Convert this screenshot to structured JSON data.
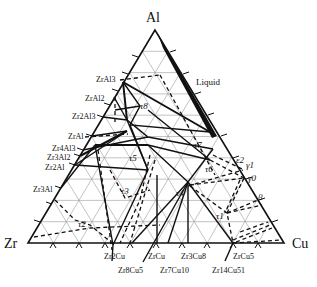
{
  "diagram": {
    "type": "ternary-phase-diagram",
    "vertices": {
      "top": "Al",
      "left": "Zr",
      "right": "Cu"
    },
    "region_label": "Liquid",
    "left_edge_phases": [
      "ZrAl3",
      "ZrAl2",
      "Zr2Al3",
      "ZrAl",
      "Zr4Al3",
      "Zr3Al2",
      "Zr2Al",
      "Zr3Al"
    ],
    "bottom_edge_phases": [
      "Zr2Cu",
      "Zr8Cu5",
      "ZrCu",
      "Zr7Cu10",
      "Zr3Cu8",
      "Zr14Cu51",
      "ZrCu5"
    ],
    "right_edge_phases": [
      "ε2",
      "γ1",
      "γ0",
      "β"
    ],
    "ternary_phases": [
      "τ1",
      "τ2",
      "τ3",
      "τ4",
      "τ5",
      "τ6",
      "τ7",
      "τ8"
    ],
    "labels": {
      "al": "Al",
      "zr": "Zr",
      "cu": "Cu",
      "liquid": "Liquid",
      "zral3": "ZrAl3",
      "zral2": "ZrAl2",
      "zr2al3": "Zr2Al3",
      "zral": "ZrAl",
      "zr4al3": "Zr4Al3",
      "zr3al2": "Zr3Al2",
      "zr2al": "Zr2Al",
      "zr3al": "Zr3Al",
      "zr2cu": "Zr2Cu",
      "zr8cu5": "Zr8Cu5",
      "zrcu": "ZrCu",
      "zr7cu10": "Zr7Cu10",
      "zr3cu8": "Zr3Cu8",
      "zr14cu51": "Zr14Cu51",
      "zrcu5": "ZrCu5",
      "eps2": "ε2",
      "gamma1": "γ1",
      "gamma0": "γ0",
      "beta": "β",
      "tau1": "τ1",
      "tau2": "τ2",
      "tau3": "τ3",
      "tau4": "τ4",
      "tau5": "τ5",
      "tau6": "τ6",
      "tau7": "τ7",
      "tau8": "τ8"
    }
  }
}
